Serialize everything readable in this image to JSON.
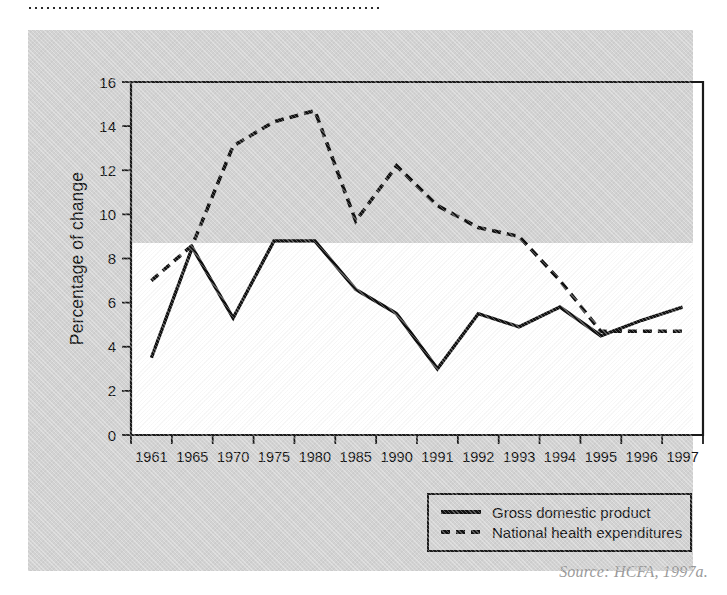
{
  "figure": {
    "source_note": "Source: HCFA, 1997a.",
    "panel_color": "#d2d2d2",
    "plot_background": "#ffffff",
    "line_color": "#111111"
  },
  "legend": {
    "items": [
      {
        "label": "Gross domestic product",
        "style": "solid"
      },
      {
        "label": "National health expenditures",
        "style": "dashed"
      }
    ]
  },
  "chart_data": {
    "type": "line",
    "title": "",
    "xlabel": "",
    "ylabel": "Percentage of change",
    "categories": [
      "1961",
      "1965",
      "1970",
      "1975",
      "1980",
      "1985",
      "1990",
      "1991",
      "1992",
      "1993",
      "1994",
      "1995",
      "1996",
      "1997"
    ],
    "yticks": [
      "0",
      "2",
      "4",
      "6",
      "8",
      "10",
      "12",
      "14",
      "16"
    ],
    "ylim": [
      0,
      16
    ],
    "grid": false,
    "legend_position": "bottom-right",
    "series": [
      {
        "name": "Gross domestic product",
        "style": "solid",
        "values": [
          3.5,
          8.5,
          5.3,
          8.8,
          8.8,
          6.6,
          5.5,
          3.0,
          5.5,
          4.9,
          5.8,
          4.5,
          5.2,
          5.8
        ]
      },
      {
        "name": "National health expenditures",
        "style": "dashed",
        "values": [
          7.0,
          8.6,
          13.1,
          14.2,
          14.7,
          9.7,
          12.2,
          10.4,
          9.4,
          9.0,
          7.0,
          4.7,
          4.7,
          4.7
        ]
      }
    ]
  }
}
